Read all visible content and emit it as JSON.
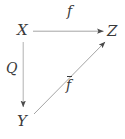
{
  "diagram": {
    "type": "commutative-triangle",
    "canvas": {
      "width": 125,
      "height": 139,
      "background": "#ffffff"
    },
    "colors": {
      "arrow_stroke": "#9a9a9a",
      "arrowhead_fill": "#4a4a4a",
      "text": "#3a3a3a"
    },
    "nodes": [
      {
        "id": "X",
        "label": "X",
        "x": 23,
        "y": 31
      },
      {
        "id": "Z",
        "label": "Z",
        "x": 113,
        "y": 31
      },
      {
        "id": "Y",
        "label": "Y",
        "x": 23,
        "y": 122
      }
    ],
    "arrows": [
      {
        "id": "x-to-z",
        "from": "X",
        "to": "Z",
        "label": "f",
        "label_has_overline": false,
        "start": {
          "x": 33,
          "y": 31
        },
        "end": {
          "x": 104,
          "y": 31
        }
      },
      {
        "id": "x-to-y",
        "from": "X",
        "to": "Y",
        "label": "Q",
        "label_has_overline": false,
        "start": {
          "x": 23,
          "y": 42
        },
        "end": {
          "x": 23,
          "y": 108
        }
      },
      {
        "id": "y-to-z",
        "from": "Y",
        "to": "Z",
        "label": "f",
        "label_has_overline": true,
        "start": {
          "x": 34,
          "y": 114
        },
        "end": {
          "x": 106,
          "y": 41
        }
      }
    ]
  }
}
